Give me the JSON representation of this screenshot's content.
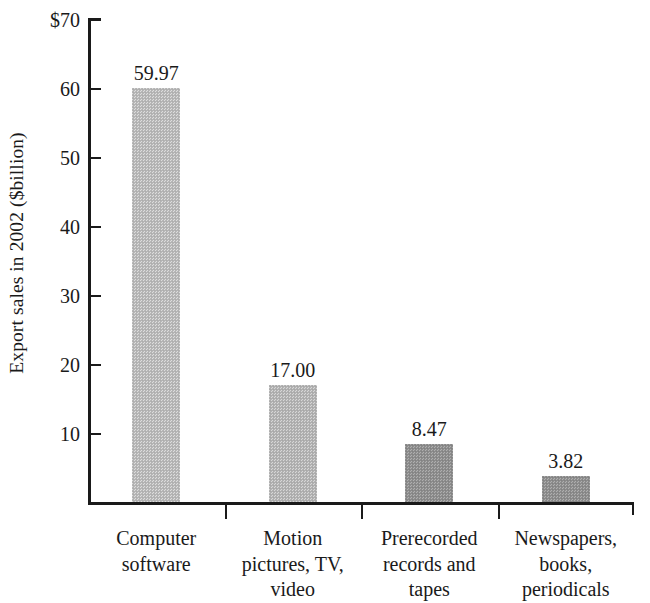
{
  "chart_data": {
    "type": "bar",
    "title": "",
    "xlabel": "",
    "ylabel": "Export sales in 2002 ($billion)",
    "categories": [
      "Computer software",
      "Motion pictures, TV, video",
      "Prerecorded records and tapes",
      "Newspapers, books, periodicals"
    ],
    "category_lines": [
      [
        "Computer",
        "software"
      ],
      [
        "Motion",
        "pictures, TV,",
        "video"
      ],
      [
        "Prerecorded",
        "records and",
        "tapes"
      ],
      [
        "Newspapers,",
        "books,",
        "periodicals"
      ]
    ],
    "values": [
      59.97,
      17.0,
      8.47,
      3.82
    ],
    "value_labels": [
      "59.97",
      "17.00",
      "8.47",
      "3.82"
    ],
    "ylim": [
      0,
      70
    ],
    "ytick_values": [
      70,
      60,
      50,
      40,
      30,
      20,
      10
    ],
    "ytick_labels": [
      "$70",
      "60",
      "50",
      "40",
      "30",
      "20",
      "10"
    ],
    "grid": false,
    "legend": false,
    "bar_colors": [
      "#b9b9b9",
      "#b4b4b4",
      "#8f8f8f",
      "#8a8a8a"
    ],
    "bar_textures": [
      "tex-light",
      "tex-mid",
      "tex-dark",
      "tex-dark"
    ],
    "axis_color": "#1a1a1a"
  },
  "axis": {
    "y_title": "Export sales in 2002 ($billion)"
  }
}
